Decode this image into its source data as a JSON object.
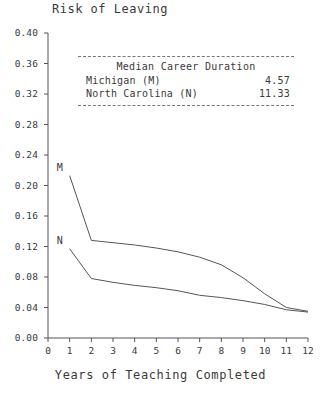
{
  "chart_data": {
    "type": "line",
    "title": "Risk of Leaving",
    "xlabel": "Years of Teaching Completed",
    "ylabel": "",
    "xlim": [
      0,
      12
    ],
    "ylim": [
      0.0,
      0.4
    ],
    "grid": false,
    "legend_position": "upper-center",
    "xticks": [
      "0",
      "1",
      "2",
      "3",
      "4",
      "5",
      "6",
      "7",
      "8",
      "9",
      "10",
      "11",
      "12"
    ],
    "yticks": [
      "0.00",
      "0.04",
      "0.08",
      "0.12",
      "0.16",
      "0.20",
      "0.24",
      "0.28",
      "0.32",
      "0.36",
      "0.40"
    ],
    "x": [
      1,
      2,
      3,
      4,
      5,
      6,
      7,
      8,
      9,
      10,
      11,
      12
    ],
    "series": [
      {
        "name": "Michigan (M)",
        "marker_label": "M",
        "color": "#555555",
        "values": [
          0.213,
          0.128,
          0.125,
          0.122,
          0.118,
          0.113,
          0.106,
          0.096,
          0.079,
          0.058,
          0.04,
          0.035
        ]
      },
      {
        "name": "North Carolina (N)",
        "marker_label": "N",
        "color": "#555555",
        "values": [
          0.117,
          0.078,
          0.073,
          0.069,
          0.066,
          0.062,
          0.056,
          0.053,
          0.049,
          0.044,
          0.037,
          0.034
        ]
      }
    ],
    "annotations": {
      "legend_title": "Median Career Duration",
      "rows": [
        {
          "label": "Michigan (M)",
          "value": "4.57"
        },
        {
          "label": "North Carolina (N)",
          "value": "11.33"
        }
      ]
    }
  },
  "axis_geometry": {
    "left_px": 48,
    "right_px": 308,
    "top_px": 33,
    "bottom_px": 338
  }
}
